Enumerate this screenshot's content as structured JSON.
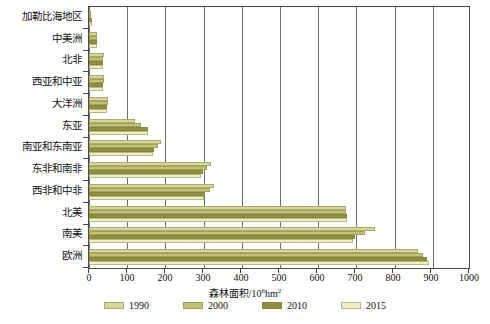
{
  "chart_data": {
    "type": "bar",
    "orientation": "horizontal",
    "title": "",
    "xlabel": "森林面积/10⁶hm²",
    "ylabel": "",
    "xlim": [
      0,
      1000
    ],
    "xticks": [
      0,
      100,
      200,
      300,
      400,
      500,
      600,
      700,
      800,
      900,
      1000
    ],
    "xtick_labels": [
      "0",
      "100",
      "200",
      "300",
      "400",
      "500",
      "600",
      "700",
      "800",
      "900",
      "1000"
    ],
    "grid": true,
    "legend_position": "bottom",
    "categories": [
      "加勒比海地区",
      "中美洲",
      "北非",
      "西亚和中亚",
      "大洋洲",
      "东亚",
      "南亚和东南亚",
      "东非和南非",
      "西非和中非",
      "北美",
      "南美",
      "欧洲"
    ],
    "series": [
      {
        "name": "1990",
        "color": "#d7d69a",
        "values": [
          6,
          22,
          39,
          40,
          51,
          120,
          190,
          320,
          330,
          676,
          752,
          867
        ]
      },
      {
        "name": "2000",
        "color": "#c2c276",
        "values": [
          6,
          21,
          37,
          39,
          49,
          138,
          182,
          310,
          318,
          677,
          727,
          880
        ]
      },
      {
        "name": "2010",
        "color": "#8f9140",
        "values": [
          7,
          20,
          36,
          38,
          48,
          154,
          172,
          300,
          306,
          679,
          701,
          890
        ]
      },
      {
        "name": "2015",
        "color": "#eeedc8",
        "values": [
          7,
          20,
          36,
          38,
          47,
          156,
          168,
          296,
          302,
          680,
          694,
          895
        ]
      }
    ]
  },
  "legend": {
    "items": [
      {
        "label": "1990",
        "color": "#d7d69a"
      },
      {
        "label": "2000",
        "color": "#c2c276"
      },
      {
        "label": "2010",
        "color": "#8f9140"
      },
      {
        "label": "2015",
        "color": "#eeedc8"
      }
    ]
  },
  "axis": {
    "x_title_main": "森林面积/10",
    "x_title_sup": "6",
    "x_title_tail": "hm",
    "x_title_sup2": "2"
  }
}
